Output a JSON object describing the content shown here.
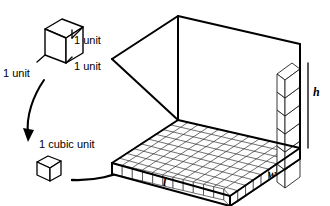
{
  "figure": {
    "stroke_color": "#000000",
    "fill_color": "#ffffff",
    "background": "#ffffff",
    "grid_line_color": "#1a1a1a"
  },
  "unit_cube": {
    "label_right": "1 unit",
    "label_front": "1 unit",
    "label_left": "1 unit"
  },
  "cubic_unit": {
    "label": "1 cubic unit"
  },
  "prism": {
    "label_length": "l",
    "label_width": "w",
    "label_height": "h",
    "floor_cells_length": 12,
    "floor_cells_width": 9,
    "column_cubes": 6
  },
  "arrows": {
    "curved_down_left": "arrow-curve-down-left",
    "curved_right": "arrow-curve-right"
  }
}
